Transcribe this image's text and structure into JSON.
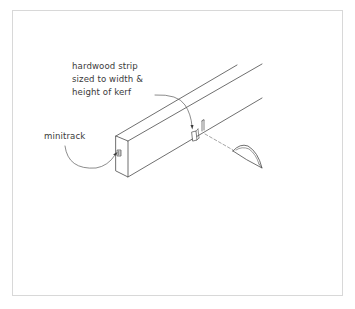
{
  "figure": {
    "type": "isometric woodworking illustration",
    "callouts": [
      {
        "id": "hardwood-strip",
        "lines": [
          "hardwood strip",
          "sized to width &",
          "height of kerf"
        ]
      },
      {
        "id": "minitrack",
        "lines": [
          "minitrack"
        ]
      }
    ],
    "colors": {
      "line": "#4a4a4a",
      "leader": "#5a5a5a",
      "frame": "#d8d8d8",
      "background": "#ffffff"
    }
  }
}
